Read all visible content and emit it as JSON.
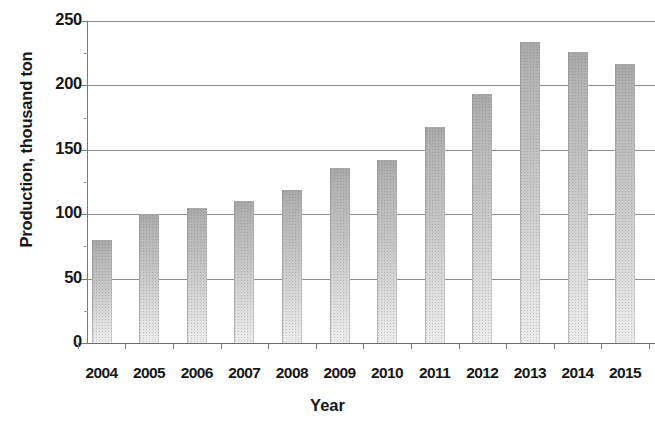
{
  "chart_data": {
    "type": "bar",
    "title": "",
    "xlabel": "Year",
    "ylabel": "Production, thousand ton",
    "categories": [
      "2004",
      "2005",
      "2006",
      "2007",
      "2008",
      "2009",
      "2010",
      "2011",
      "2012",
      "2013",
      "2014",
      "2015"
    ],
    "values": [
      80,
      100,
      105,
      110,
      119,
      136,
      142,
      168,
      193,
      234,
      226,
      217
    ],
    "ylim": [
      0,
      250
    ],
    "y_ticks": [
      0,
      50,
      100,
      150,
      200,
      250
    ],
    "y_tick_labels": [
      "0",
      "50",
      "100",
      "150",
      "200",
      "250"
    ],
    "grid": "horizontal",
    "legend": "none",
    "series": [
      {
        "name": "Production",
        "values": [
          80,
          100,
          105,
          110,
          119,
          136,
          142,
          168,
          193,
          234,
          226,
          217
        ]
      }
    ],
    "bar_color": "#c4c4c4",
    "gridline_color": "#8e8e8e",
    "text_color": "#171717"
  }
}
